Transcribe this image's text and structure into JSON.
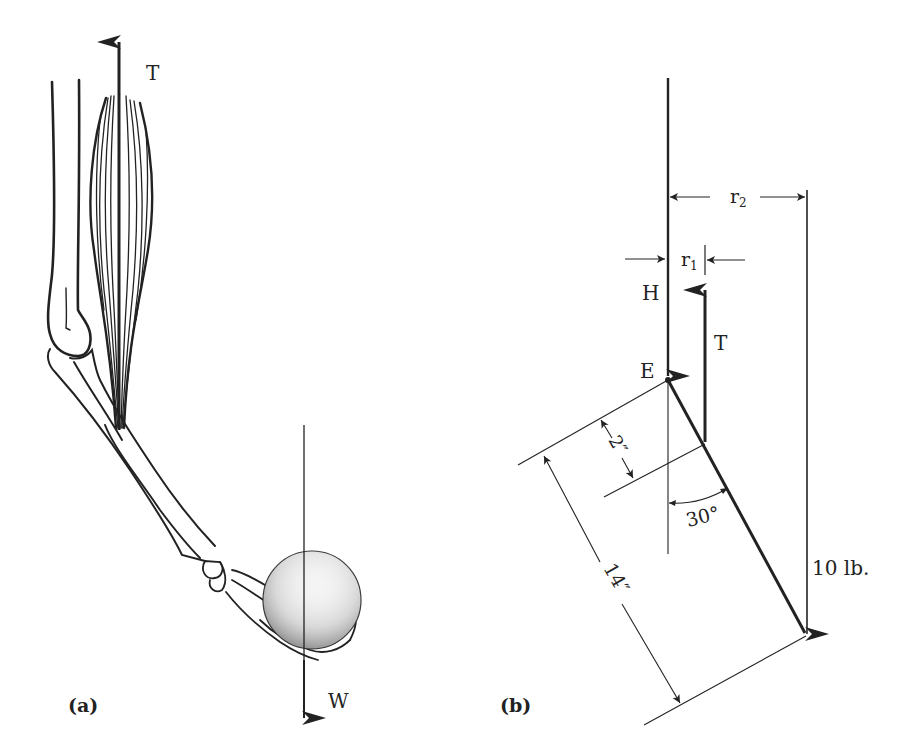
{
  "panel_a": {
    "label": "(a)",
    "tension_label": "T",
    "weight_label": "W"
  },
  "panel_b": {
    "label": "(b)",
    "tension_label": "T",
    "hinge_force_label": "H",
    "elbow_label": "E",
    "r1_label": "r",
    "r1_sub": "1",
    "r2_label": "r",
    "r2_sub": "2",
    "angle_label": "30°",
    "short_dim_label": "2″",
    "long_dim_label": "14″",
    "load_label": "10 lb."
  },
  "colors": {
    "ink": "#222222",
    "background": "#ffffff"
  }
}
